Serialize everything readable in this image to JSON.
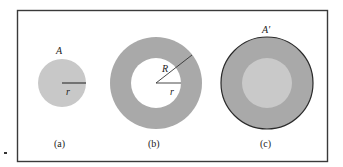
{
  "figure": {
    "colors": {
      "frame": "#3a3a3a",
      "light_fill": "#c8c8c8",
      "dark_fill": "#a9a9a9",
      "inner_light": "#c9c9c9",
      "outline": "#2a2a2a",
      "background": "#ffffff"
    },
    "panels": [
      {
        "id": "a",
        "caption": "(a)",
        "area_label": "A",
        "radius_label": "r"
      },
      {
        "id": "b",
        "caption": "(b)",
        "outer_radius_label": "R",
        "inner_radius_label": "r"
      },
      {
        "id": "c",
        "caption": "(c)",
        "area_label": "A′"
      }
    ]
  }
}
